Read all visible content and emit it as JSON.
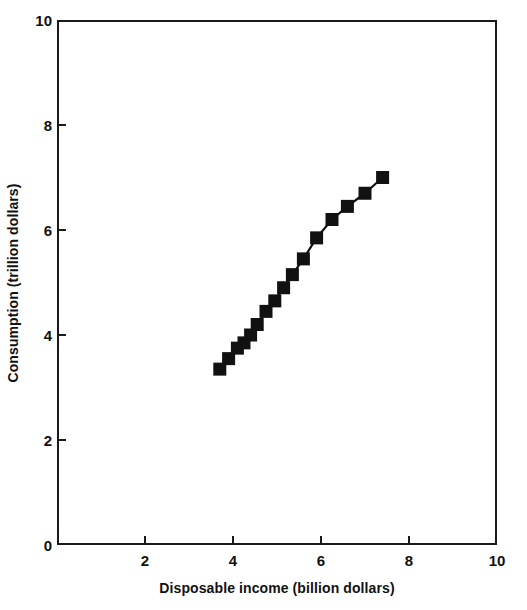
{
  "chart_data": {
    "type": "line",
    "title": "",
    "subtitle": "",
    "xlabel": "Disposable income (billion dollars)",
    "ylabel": "Consumption (trillion dollars)",
    "xlim": [
      0,
      10
    ],
    "ylim": [
      0,
      10
    ],
    "xticks": [
      0,
      2,
      4,
      6,
      8,
      10
    ],
    "yticks": [
      0,
      2,
      4,
      6,
      8,
      10
    ],
    "xtick_labels": [
      "0",
      "2",
      "4",
      "6",
      "8",
      "10"
    ],
    "ytick_labels": [
      "0",
      "2",
      "4",
      "6",
      "8",
      "10"
    ],
    "grid": false,
    "legend": null,
    "marker": "filled-square",
    "marker_color": "#111111",
    "line_color": "#111111",
    "series": [
      {
        "name": "Consumption function",
        "x": [
          3.7,
          3.9,
          4.1,
          4.25,
          4.4,
          4.55,
          4.75,
          4.95,
          5.15,
          5.35,
          5.6,
          5.9,
          6.25,
          6.6,
          7.0,
          7.4
        ],
        "y": [
          3.35,
          3.55,
          3.75,
          3.85,
          4.0,
          4.2,
          4.45,
          4.65,
          4.9,
          5.15,
          5.45,
          5.85,
          6.2,
          6.45,
          6.7,
          7.0
        ]
      }
    ],
    "axes_pixels": {
      "left": 57,
      "right": 497,
      "top": 20,
      "bottom": 545
    }
  }
}
